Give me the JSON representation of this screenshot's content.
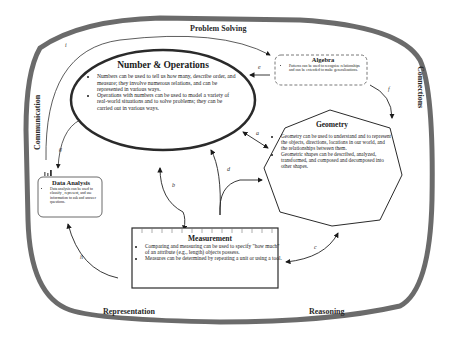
{
  "frame_labels": {
    "top": "Problem Solving",
    "left": "Communication",
    "right": "Connections",
    "bottom_left": "Representation",
    "bottom_right": "Reasoning"
  },
  "nodes": {
    "number_operations": {
      "title": "Number & Operations",
      "bullets": [
        "Numbers can be used to tell us how many, describe order, and measure; they involve numerous relations, and can be represented in various ways.",
        "Operations with numbers can be used to model a variety of real-world situations and to solve problems; they can be carried out in various ways."
      ]
    },
    "algebra": {
      "title": "Algebra",
      "bullets": [
        "Patterns can be used to recognize relationships and can be extended to make generalizations."
      ]
    },
    "geometry": {
      "title": "Geometry",
      "bullets": [
        "Geometry can be used to understand and to represent the objects, directions, locations in our world, and the relationships between them.",
        "Geometric shapes can be described, analyzed, transformed, and composed and decomposed into other shapes."
      ]
    },
    "data_analysis": {
      "title": "Data Analysis",
      "bullets": [
        "Data analysis can be used to classify , represent, and use information to ask and answer questions."
      ]
    },
    "measurement": {
      "title": "Measurement",
      "bullets": [
        "Comparing and measuring can be used to specify \"how much\" of an attribute (e.g., length) objects possess.",
        "Measures can be determined by repeating a unit or using a tool."
      ]
    }
  },
  "edges": [
    {
      "label": "a",
      "from": "geometry",
      "to": "number_operations",
      "bidirectional": true
    },
    {
      "label": "b",
      "from": "measurement",
      "to": "number_operations",
      "bidirectional": true
    },
    {
      "label": "c",
      "from": "geometry",
      "to": "measurement",
      "bidirectional": true
    },
    {
      "label": "d",
      "from": "measurement",
      "to": "number_operations_and_geometry",
      "bidirectional": false
    },
    {
      "label": "e",
      "from": "algebra",
      "to": "number_operations",
      "bidirectional": false
    },
    {
      "label": "f",
      "from": "algebra",
      "to": "geometry",
      "bidirectional": false
    },
    {
      "label": "g",
      "from": "number_operations",
      "to": "data_analysis",
      "bidirectional": false
    },
    {
      "label": "h",
      "from": "measurement",
      "to": "data_analysis",
      "bidirectional": false
    },
    {
      "label": "i",
      "from": "number_operations",
      "to": "algebra",
      "bidirectional": false
    }
  ],
  "colors": {
    "frame": "#6b6b6b",
    "stroke": "#2a2a2a",
    "text": "#1a1a1a"
  }
}
